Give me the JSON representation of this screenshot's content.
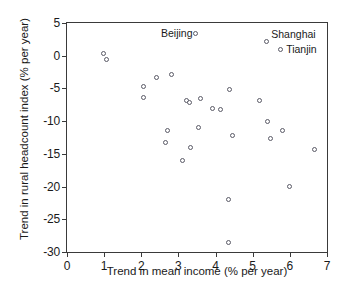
{
  "chart_data": {
    "type": "scatter",
    "title": "",
    "xlabel": "Trend in mean income (% per year)",
    "ylabel": "Trend in rural headcount index (% per year)",
    "xlim": [
      0,
      7
    ],
    "ylim": [
      -30,
      5
    ],
    "xticks": [
      0,
      1,
      2,
      3,
      4,
      5,
      6,
      7
    ],
    "yticks": [
      5,
      0,
      -5,
      -10,
      -15,
      -20,
      -25,
      -30
    ],
    "xtick_labels": [
      "0",
      "1",
      "2",
      "3",
      "4",
      "5",
      "6",
      "7"
    ],
    "ytick_labels": [
      "5",
      "0",
      "-5",
      "-10",
      "-15",
      "-20",
      "-25",
      "-30"
    ],
    "grid": false,
    "legend": false,
    "marker": "open-circle",
    "marker_color": "#5a5a66",
    "points": [
      {
        "x": 0.97,
        "y": 0.4,
        "label": ""
      },
      {
        "x": 1.06,
        "y": -0.6,
        "label": ""
      },
      {
        "x": 2.05,
        "y": -4.7,
        "label": ""
      },
      {
        "x": 2.05,
        "y": -6.4,
        "label": ""
      },
      {
        "x": 2.42,
        "y": -3.4,
        "label": ""
      },
      {
        "x": 2.66,
        "y": -13.2,
        "label": ""
      },
      {
        "x": 2.7,
        "y": -11.5,
        "label": ""
      },
      {
        "x": 2.82,
        "y": -2.9,
        "label": ""
      },
      {
        "x": 3.1,
        "y": -16.0,
        "label": ""
      },
      {
        "x": 3.22,
        "y": -6.9,
        "label": ""
      },
      {
        "x": 3.3,
        "y": -7.1,
        "label": ""
      },
      {
        "x": 3.33,
        "y": -14.0,
        "label": ""
      },
      {
        "x": 3.45,
        "y": 3.4,
        "label": "Beijing"
      },
      {
        "x": 3.53,
        "y": -10.9,
        "label": ""
      },
      {
        "x": 3.6,
        "y": -6.5,
        "label": ""
      },
      {
        "x": 3.92,
        "y": -8.0,
        "label": ""
      },
      {
        "x": 4.12,
        "y": -8.2,
        "label": ""
      },
      {
        "x": 4.35,
        "y": -22.0,
        "label": ""
      },
      {
        "x": 4.35,
        "y": -28.5,
        "label": ""
      },
      {
        "x": 4.37,
        "y": -5.2,
        "label": ""
      },
      {
        "x": 4.45,
        "y": -12.2,
        "label": ""
      },
      {
        "x": 5.18,
        "y": -6.9,
        "label": ""
      },
      {
        "x": 5.38,
        "y": 2.2,
        "label": "Shanghai"
      },
      {
        "x": 5.4,
        "y": -10.0,
        "label": ""
      },
      {
        "x": 5.48,
        "y": -12.6,
        "label": ""
      },
      {
        "x": 5.75,
        "y": 1.0,
        "label": "Tianjin"
      },
      {
        "x": 5.8,
        "y": -11.4,
        "label": ""
      },
      {
        "x": 6.0,
        "y": -20.0,
        "label": ""
      },
      {
        "x": 6.65,
        "y": -14.3,
        "label": ""
      }
    ],
    "annotations": [
      {
        "text": "Beijing",
        "x": 3.38,
        "y": 3.4,
        "align": "right"
      },
      {
        "text": "Shanghai",
        "x": 5.5,
        "y": 3.3,
        "align": "left"
      },
      {
        "text": "Tianjin",
        "x": 5.9,
        "y": 1.0,
        "align": "left"
      }
    ]
  }
}
